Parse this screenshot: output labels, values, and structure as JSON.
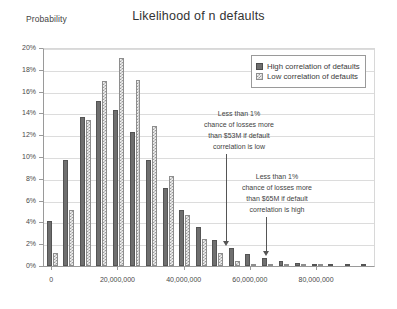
{
  "chart_data": {
    "type": "bar",
    "title": "Likelihood of n defaults",
    "xlabel": "Loss ($)",
    "ylabel": "Probability",
    "grid": true,
    "legend_position": "top-right",
    "ylim": [
      0,
      20
    ],
    "ytick_labels": [
      "0%",
      "2%",
      "4%",
      "6%",
      "8%",
      "10%",
      "12%",
      "14%",
      "16%",
      "18%",
      "20%"
    ],
    "ytick_values": [
      0,
      2,
      4,
      6,
      8,
      10,
      12,
      14,
      16,
      18,
      20
    ],
    "xlim": [
      -2500000,
      97500000
    ],
    "xtick_labels": [
      "0",
      "20,000,000",
      "40,000,000",
      "60,000,000",
      "80,000,000"
    ],
    "xtick_values": [
      0,
      20000000,
      40000000,
      60000000,
      80000000
    ],
    "x": [
      0,
      5000000,
      10000000,
      15000000,
      20000000,
      25000000,
      30000000,
      35000000,
      40000000,
      45000000,
      50000000,
      55000000,
      60000000,
      65000000,
      70000000,
      75000000,
      80000000,
      85000000,
      90000000,
      95000000
    ],
    "categories": [
      "0",
      "5,000,000",
      "10,000,000",
      "15,000,000",
      "20,000,000",
      "25,000,000",
      "30,000,000",
      "35,000,000",
      "40,000,000",
      "45,000,000",
      "50,000,000",
      "55,000,000",
      "60,000,000",
      "65,000,000",
      "70,000,000",
      "75,000,000",
      "80,000,000",
      "85,000,000",
      "90,000,000",
      "95,000,000"
    ],
    "series": [
      {
        "name": "High correlation of defaults",
        "color": "#6f6f6f",
        "pattern": "solid",
        "values": [
          4.1,
          9.7,
          13.7,
          15.1,
          14.3,
          12.3,
          9.7,
          7.2,
          5.1,
          3.6,
          2.4,
          1.65,
          1.1,
          0.75,
          0.5,
          0.32,
          0.2,
          0.14,
          0.09,
          0.07
        ]
      },
      {
        "name": "Low correlation of defaults",
        "color": "#9c9c9c",
        "pattern": "checkered",
        "values": [
          1.2,
          5.1,
          13.4,
          17.0,
          19.1,
          17.1,
          12.8,
          8.25,
          4.65,
          2.45,
          1.2,
          0.45,
          0.2,
          0.08,
          0.04,
          0.02,
          0.01,
          0.0,
          0.0,
          0.0
        ]
      }
    ],
    "annotations": [
      {
        "id": "annotation-low-correlation",
        "lines": [
          "Less than 1%",
          "chance of losses more",
          "than $53M if default",
          "correlation is low"
        ],
        "points_to_x": 53000000
      },
      {
        "id": "annotation-high-correlation",
        "lines": [
          "Less than 1%",
          "chance of losses more",
          "than $65M if default",
          "correlation is high"
        ],
        "points_to_x": 65000000
      }
    ]
  }
}
